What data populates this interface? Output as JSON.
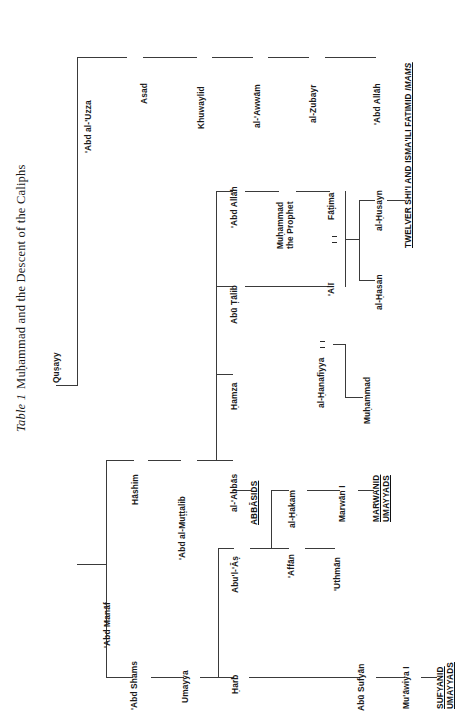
{
  "caption": {
    "label": "Table 1",
    "text": "Muḥammad and the Descent of the Caliphs"
  },
  "nodes": {
    "qusayy": "Quṣayy",
    "abd_al_uzza": "'Abd al-'Uzza",
    "asad": "Asad",
    "khuwaylid": "Khuwaylid",
    "al_awwam": "al-'Awwām",
    "al_zubayr": "al-Zubayr",
    "abd_allah_zubayr": "'Abd Allāh",
    "abd_manaf": "'Abd Manāf",
    "hashim": "Hāshim",
    "abd_al_muttalib": "'Abd al-Muṭṭalib",
    "al_abbas": "al-'Abbās",
    "hamza": "Ḥamza",
    "abu_talib": "Abū Ṭālib",
    "abd_allah": "'Abd Allāh",
    "muhammad_line1": "Muḥammad",
    "muhammad_line2": "the Prophet",
    "fatima": "Fāṭima",
    "ali": "'Alī",
    "al_hasan": "al-Ḥasan",
    "al_husayn": "al-Ḥusayn",
    "al_hanafiyya": "al-Ḥanafiyya",
    "muhammad_ibn": "Muḥammad",
    "abd_shams": "'Abd Shams",
    "umayya": "Umayya",
    "harb": "Ḥarb",
    "abu_sufyan": "Abū Sufyān",
    "muawiya": "Mu'āwiya I",
    "abul_as": "Abu'l-'Āṣ",
    "affan": "'Affān",
    "uthman": "'Uthmān",
    "al_hakam": "al-Ḥakam",
    "marwan": "Marwān I"
  },
  "group_labels": {
    "abbasids": "ABBĀSIDS",
    "twelver_line1": "TWELVER SHI'I AND ISMA'ILI FATIMID ",
    "twelver_imams": "IMAMS",
    "marwanid_line1": "MARWANID",
    "marwanid_line2": "UMAYYADS",
    "sufyanid_line1": "SUFYANID",
    "sufyanid_line2": "UMAYYADS"
  },
  "colors": {
    "line": "#3a3a3a",
    "text": "#1a1a1a",
    "background": "#ffffff"
  }
}
